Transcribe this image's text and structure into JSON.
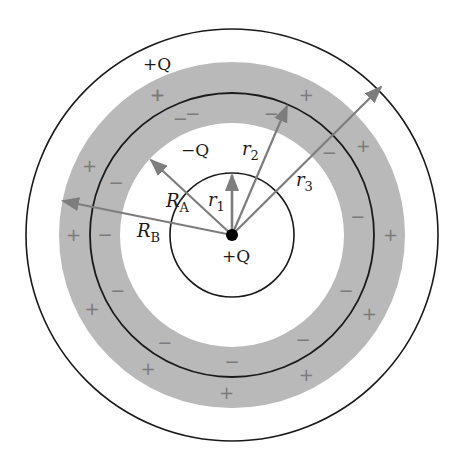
{
  "diagram": {
    "type": "concentric-spherical-shell-charges",
    "colors": {
      "background": "#ffffff",
      "shell_fill": "#b9b9b9",
      "circle_stroke": "#1a1a1a",
      "arrow": "#7d7d7d",
      "sign": "#7a7a7a",
      "point_charge": "#000000"
    },
    "geometry": {
      "center": [
        232,
        235
      ],
      "inner_circle_r": 62,
      "shell_inner_r": 112,
      "middle_ring_r": 142,
      "shell_outer_r": 173,
      "outer_circle_r": 206
    },
    "labels": {
      "outer_charge": "+Q",
      "inner_surface_charge": "−Q",
      "center_charge": "+Q",
      "r1": "r",
      "r1_sub": "1",
      "r2": "r",
      "r2_sub": "2",
      "r3": "r",
      "r3_sub": "3",
      "RA": "R",
      "RA_sub": "A",
      "RB": "R",
      "RB_sub": "B"
    },
    "signs": {
      "plus": "+",
      "minus": "−"
    },
    "arrows": [
      {
        "name": "r1",
        "to": [
          232,
          175
        ]
      },
      {
        "name": "r2",
        "to": [
          287,
          106
        ]
      },
      {
        "name": "r3",
        "to": [
          381,
          87
        ]
      },
      {
        "name": "RA",
        "to": [
          151,
          160
        ]
      },
      {
        "name": "RB",
        "to": [
          63,
          201
        ]
      }
    ],
    "outer_plus_angles": [
      -118,
      -62,
      -34,
      0,
      30,
      62,
      92,
      122,
      152,
      180,
      206,
      242
    ],
    "inner_minus_angles": [
      -108,
      -72,
      -40,
      -8,
      26,
      56,
      90,
      122,
      154,
      180,
      204,
      246
    ]
  }
}
